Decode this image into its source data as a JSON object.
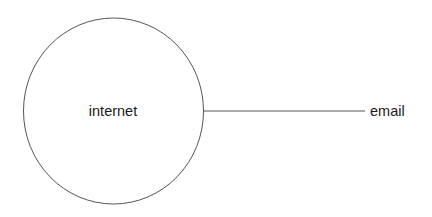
{
  "diagram": {
    "type": "node-link",
    "nodes": [
      {
        "id": "internet",
        "label": "internet",
        "shape": "circle"
      },
      {
        "id": "email",
        "label": "email",
        "shape": "text"
      }
    ],
    "edges": [
      {
        "from": "internet",
        "to": "email",
        "style": "line"
      }
    ]
  },
  "colors": {
    "stroke": "#555555",
    "text": "#1a1a1a",
    "background": "#ffffff"
  }
}
